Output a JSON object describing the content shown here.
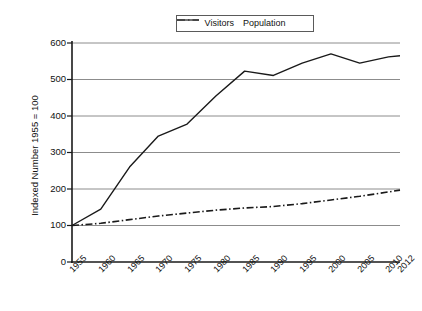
{
  "chart_data": {
    "type": "line",
    "title": "",
    "xlabel": "",
    "ylabel": "Indexed Number 1955 = 100",
    "x": [
      1955,
      1960,
      1965,
      1970,
      1975,
      1980,
      1985,
      1990,
      1995,
      2000,
      2005,
      2010,
      2012
    ],
    "categories": [
      "1955",
      "1960",
      "1965",
      "1970",
      "1975",
      "1980",
      "1985",
      "1990",
      "1995",
      "2000",
      "2005",
      "2010",
      "2012"
    ],
    "xlim": [
      1955,
      2012
    ],
    "ylim": [
      0,
      600
    ],
    "yticks": [
      0,
      100,
      200,
      300,
      400,
      500,
      600
    ],
    "ytick_labels": [
      "0",
      "100",
      "200",
      "300",
      "400",
      "500",
      "600"
    ],
    "grid": "horizontal",
    "legend_position": "top-center",
    "series": [
      {
        "name": "Visitors",
        "style": "solid",
        "color": "#1a1a1a",
        "values": [
          100,
          145,
          260,
          345,
          378,
          455,
          523,
          511,
          545,
          570,
          545,
          562,
          565
        ]
      },
      {
        "name": "Population",
        "style": "dash-dot",
        "color": "#1a1a1a",
        "values": [
          100,
          106,
          116,
          126,
          134,
          142,
          148,
          152,
          160,
          170,
          180,
          192,
          197
        ]
      }
    ]
  },
  "legend": {
    "entries": [
      {
        "label": "Visitors",
        "icon": "solid-line-icon"
      },
      {
        "label": "Population",
        "icon": "dash-dot-line-icon"
      }
    ]
  },
  "axes": {
    "y_axis_title": "Indexed Number 1955 = 100",
    "y_labels": [
      "600",
      "500",
      "400",
      "300",
      "200",
      "100",
      "0"
    ],
    "x_labels": [
      "1955",
      "1960",
      "1965",
      "1970",
      "1975",
      "1980",
      "1985",
      "1990",
      "1995",
      "2000",
      "2005",
      "2010",
      "2012"
    ]
  }
}
